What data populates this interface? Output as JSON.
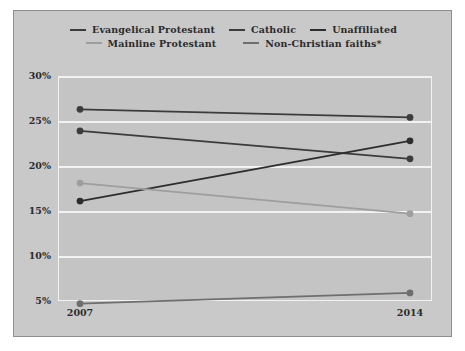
{
  "chart_data": {
    "type": "line",
    "title": "",
    "subtitle": "",
    "xlabel": "",
    "ylabel": "",
    "x": [
      "2007",
      "2014"
    ],
    "categories": [
      "2007",
      "2014"
    ],
    "ylim": [
      5,
      30
    ],
    "yticks": [
      "30%",
      "25%",
      "20%",
      "15%",
      "10%",
      "5%"
    ],
    "ytick_values": [
      30,
      25,
      20,
      15,
      10,
      5
    ],
    "grid": true,
    "legend_position": "top",
    "series": [
      {
        "name": "Evangelical Protestant",
        "values": [
          26.3,
          25.4
        ],
        "color": "#3c3c3c"
      },
      {
        "name": "Catholic",
        "values": [
          23.9,
          20.8
        ],
        "color": "#3c3c3c"
      },
      {
        "name": "Unaffiliated",
        "values": [
          16.1,
          22.8
        ],
        "color": "#2d2d2d"
      },
      {
        "name": "Mainline Protestant",
        "values": [
          18.1,
          14.7
        ],
        "color": "#9e9e9e"
      },
      {
        "name": "Non-Christian faiths*",
        "values": [
          4.7,
          5.9
        ],
        "color": "#6e6e6e"
      }
    ]
  },
  "legend": {
    "rows": [
      [
        {
          "label": "Evangelical Protestant",
          "color": "#3c3c3c"
        },
        {
          "label": "Catholic",
          "color": "#3c3c3c"
        },
        {
          "label": "Unaffiliated",
          "color": "#2d2d2d"
        }
      ],
      [
        {
          "label": "Mainline Protestant",
          "color": "#9e9e9e"
        },
        {
          "label": "Non-Christian faiths*",
          "color": "#6e6e6e"
        }
      ]
    ]
  },
  "colors": {
    "card_background": "#c9c9c9",
    "card_border": "#8e8e8e",
    "plot_background": "#c4c4c4",
    "gridline": "#f2f2f2",
    "text": "#2b2b2b",
    "page_background": "#ffffff"
  }
}
